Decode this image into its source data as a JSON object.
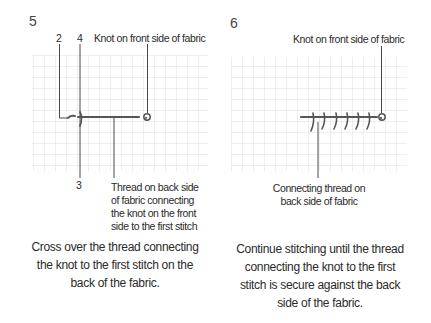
{
  "panels": [
    {
      "step": "5",
      "labels": {
        "num_2": "2",
        "num_4": "4",
        "num_3": "3",
        "knot": "Knot on front side of fabric",
        "thread_lines": [
          "Thread on back side",
          "of fabric connecting",
          "the knot on the front",
          "side to the first stitch"
        ]
      },
      "caption_lines": [
        "Cross over the thread connecting",
        "the knot to the first stitch on the",
        "back of the fabric."
      ]
    },
    {
      "step": "6",
      "labels": {
        "knot": "Knot on front side of fabric",
        "thread_lines": [
          "Connecting thread on",
          "back side of fabric"
        ]
      },
      "caption_lines": [
        "Continue stitching until the thread",
        "connecting the knot to the first",
        "stitch is secure against the back",
        "side of the fabric."
      ]
    }
  ],
  "colors": {
    "grid": "#d6d6d6",
    "thread": "#555555",
    "leader": "#444444",
    "text": "#2a2a2a"
  }
}
